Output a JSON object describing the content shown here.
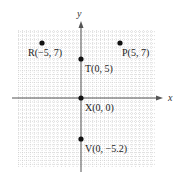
{
  "figure": {
    "x_axis_label": "x",
    "y_axis_label": "y",
    "colors": {
      "grid": "#c8c8c8",
      "axis": "#555555",
      "point": "#111111",
      "text": "#222222"
    }
  },
  "points": [
    {
      "name": "R",
      "x": -5,
      "y": 7,
      "label": "R(−5, 7)"
    },
    {
      "name": "P",
      "x": 5,
      "y": 7,
      "label": "P(5, 7)"
    },
    {
      "name": "T",
      "x": 0,
      "y": 5,
      "label": "T(0, 5)"
    },
    {
      "name": "X",
      "x": 0,
      "y": 0,
      "label": "X(0, 0)"
    },
    {
      "name": "V",
      "x": 0,
      "y": -5.2,
      "label": "V(0, −5.2)"
    }
  ],
  "chart_data": {
    "type": "scatter",
    "title": "",
    "xlabel": "x",
    "ylabel": "y",
    "grid": true,
    "xlim": [
      -8,
      9.5
    ],
    "ylim": [
      -8.8,
      8.8
    ],
    "series": [
      {
        "name": "points",
        "x": [
          -5,
          5,
          0,
          0,
          0
        ],
        "y": [
          7,
          7,
          5,
          0,
          -5.2
        ],
        "labels": [
          "R(−5, 7)",
          "P(5, 7)",
          "T(0, 5)",
          "X(0, 0)",
          "V(0, −5.2)"
        ]
      }
    ]
  }
}
